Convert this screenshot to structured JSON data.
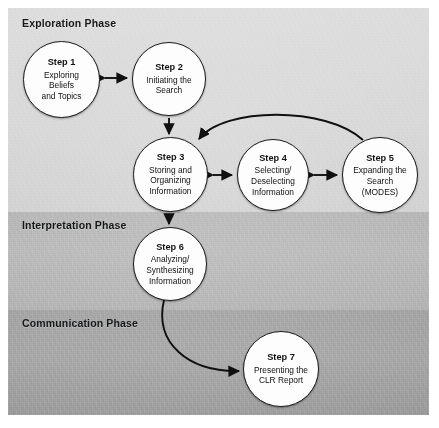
{
  "figure": {
    "phases": [
      {
        "id": "exploration",
        "label": "Exploration Phase"
      },
      {
        "id": "interpretation",
        "label": "Interpretation Phase"
      },
      {
        "id": "communication",
        "label": "Communication Phase"
      }
    ],
    "steps": [
      {
        "id": "step1",
        "title": "Step 1",
        "line1": "Exploring",
        "line2": "Beliefs",
        "line3": "and Topics"
      },
      {
        "id": "step2",
        "title": "Step 2",
        "line1": "Initiating the",
        "line2": "Search",
        "line3": ""
      },
      {
        "id": "step3",
        "title": "Step 3",
        "line1": "Storing and",
        "line2": "Organizing",
        "line3": "Information"
      },
      {
        "id": "step4",
        "title": "Step 4",
        "line1": "Selecting/",
        "line2": "Deselecting",
        "line3": "Information"
      },
      {
        "id": "step5",
        "title": "Step 5",
        "line1": "Expanding the",
        "line2": "Search",
        "line3": "(MODES)"
      },
      {
        "id": "step6",
        "title": "Step 6",
        "line1": "Analyzing/",
        "line2": "Synthesizing",
        "line3": "Information"
      },
      {
        "id": "step7",
        "title": "Step 7",
        "line1": "Presenting the",
        "line2": "CLR Report",
        "line3": ""
      }
    ],
    "colors": {
      "band_exploration": "#d6d6d6",
      "band_interpretation": "#b4b4b4",
      "band_communication": "#a2a2a2",
      "node_fill": "#fdfdfd",
      "stroke": "#1b1b1b",
      "text": "#111111"
    }
  }
}
